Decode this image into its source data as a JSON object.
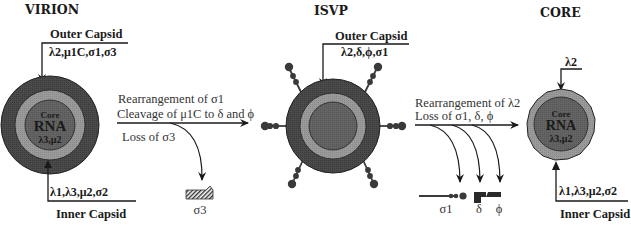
{
  "stages": {
    "virion": {
      "title": "VIRION",
      "outer_label": "Outer Capsid",
      "outer_proteins": "λ2,μ1C,σ1,σ3",
      "core_word": "Core",
      "core_rna": "RNA",
      "core_proteins": "λ3,μ2",
      "inner_proteins": "λ1,λ3,μ2,σ2",
      "inner_label": "Inner Capsid"
    },
    "isvp": {
      "title": "ISVP",
      "outer_label": "Outer Capsid",
      "outer_proteins": "λ2,δ,ϕ,σ1"
    },
    "core": {
      "title": "CORE",
      "top_protein": "λ2",
      "core_word": "Core",
      "core_rna": "RNA",
      "core_proteins": "λ3,μ2",
      "inner_proteins": "λ1,λ3,μ2,σ2",
      "inner_label": "Inner Capsid"
    }
  },
  "transitions": [
    {
      "lines": [
        "Rearrangement of σ1",
        "Cleavage of μ1C to δ and ϕ"
      ],
      "loss": "Loss of σ3",
      "fragments": [
        "σ3"
      ]
    },
    {
      "lines": [
        "Rearrangement of λ2",
        "Loss of σ1, δ, ϕ"
      ],
      "fragments": [
        "σ1",
        "δ",
        "ϕ"
      ]
    }
  ],
  "colors": {
    "outer_shell": "#4a4a4a",
    "inner_ring": "#9a9a9a",
    "core_center": "#5e5e5e",
    "line": "#1a1a1a"
  }
}
